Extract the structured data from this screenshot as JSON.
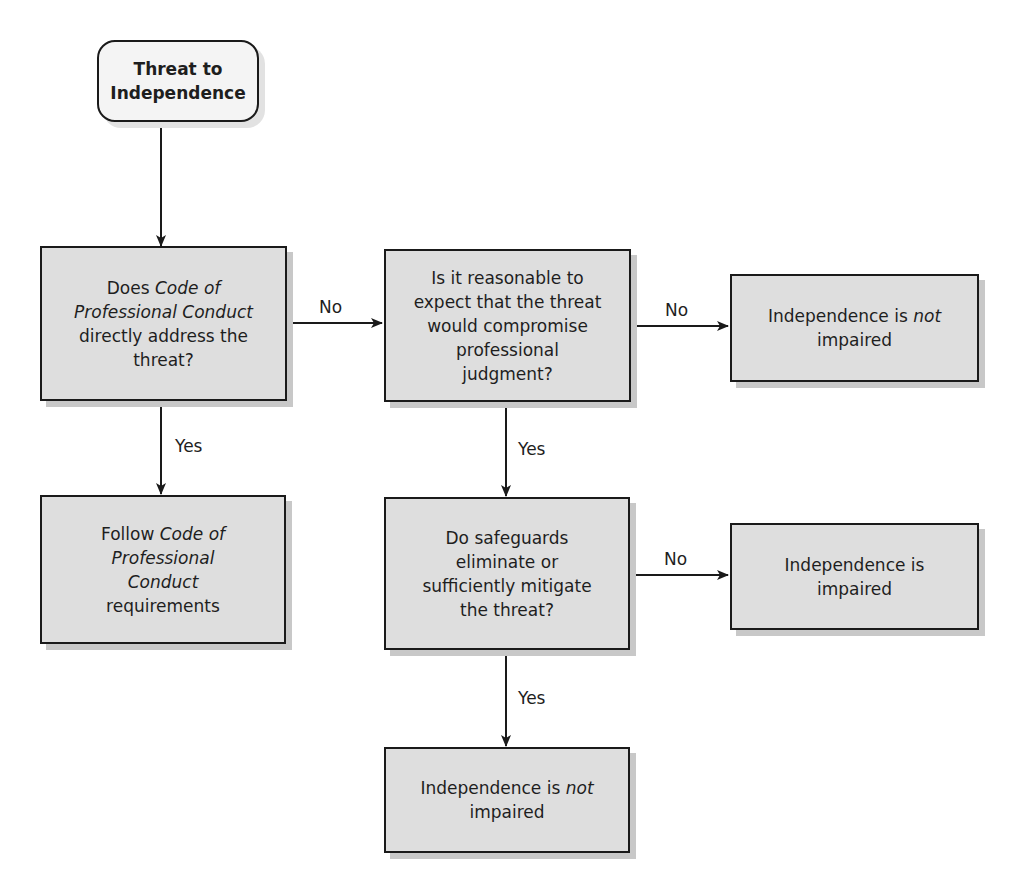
{
  "nodes": {
    "start": {
      "line1": "Threat to",
      "line2": "Independence"
    },
    "q1": {
      "l1a": "Does ",
      "l1b": "Code of",
      "l2": "Professional Conduct",
      "l3": "directly address the",
      "l4": "threat?"
    },
    "follow": {
      "l1a": "Follow ",
      "l1b": "Code of",
      "l2": "Professional",
      "l3": "Conduct",
      "l4": "requirements"
    },
    "q2": {
      "l1": "Is it reasonable to",
      "l2": "expect that the threat",
      "l3": "would compromise",
      "l4": "professional",
      "l5": "judgment?"
    },
    "not_impaired_1": {
      "l1a": "Independence is ",
      "l1b": "not",
      "l2": "impaired"
    },
    "q3": {
      "l1": "Do safeguards",
      "l2": "eliminate or",
      "l3": "sufficiently mitigate",
      "l4": "the threat?"
    },
    "impaired": {
      "l1": "Independence is",
      "l2": "impaired"
    },
    "not_impaired_2": {
      "l1a": "Independence is ",
      "l1b": "not",
      "l2": "impaired"
    }
  },
  "edge_labels": {
    "q1_no": "No",
    "q1_yes": "Yes",
    "q2_no": "No",
    "q2_yes": "Yes",
    "q3_no": "No",
    "q3_yes": "Yes"
  }
}
